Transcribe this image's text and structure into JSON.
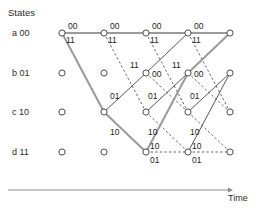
{
  "figure": {
    "type": "trellis-diagram",
    "title": "States",
    "axis_label": "Time",
    "states": [
      {
        "key": "a",
        "bits": "00",
        "label": "a 00",
        "row": 0
      },
      {
        "key": "b",
        "bits": "01",
        "label": "b 01",
        "row": 1
      },
      {
        "key": "c",
        "bits": "10",
        "label": "c 10",
        "row": 2
      },
      {
        "key": "d",
        "bits": "11",
        "label": "d 11",
        "row": 3
      }
    ],
    "colors": {
      "node_stroke": "#3a3a3a",
      "node_fill": "#ffffff",
      "edge_solid": "#3a3a3a",
      "edge_dashed": "#4a4a4a",
      "edge_highlight": "#9a9a9a",
      "axis": "#8a8a8a",
      "text": "#2b2b2b"
    },
    "geometry": {
      "columns_x": [
        62,
        104,
        146,
        188,
        230
      ],
      "rows_y": [
        33,
        73,
        112,
        152
      ],
      "node_radius": 3.1,
      "axis_y": 190,
      "axis_x_start": 8,
      "axis_x_end": 228
    },
    "nodes": [
      {
        "col": 0,
        "row": 0
      },
      {
        "col": 0,
        "row": 1
      },
      {
        "col": 0,
        "row": 2
      },
      {
        "col": 0,
        "row": 3
      },
      {
        "col": 1,
        "row": 0
      },
      {
        "col": 1,
        "row": 1
      },
      {
        "col": 1,
        "row": 2
      },
      {
        "col": 1,
        "row": 3
      },
      {
        "col": 2,
        "row": 0
      },
      {
        "col": 2,
        "row": 1
      },
      {
        "col": 2,
        "row": 2
      },
      {
        "col": 2,
        "row": 3
      },
      {
        "col": 3,
        "row": 0
      },
      {
        "col": 3,
        "row": 1
      },
      {
        "col": 3,
        "row": 2
      },
      {
        "col": 3,
        "row": 3
      },
      {
        "col": 4,
        "row": 0
      },
      {
        "col": 4,
        "row": 1
      },
      {
        "col": 4,
        "row": 2
      },
      {
        "col": 4,
        "row": 3
      }
    ],
    "edges": [
      {
        "from": [
          0,
          0
        ],
        "to": [
          1,
          0
        ],
        "style": "solid",
        "highlight": true,
        "label": "00",
        "label_pos": "above-start"
      },
      {
        "from": [
          0,
          0
        ],
        "to": [
          1,
          2
        ],
        "style": "solid",
        "highlight": true,
        "label": "11",
        "label_pos": "below-start"
      },
      {
        "from": [
          1,
          0
        ],
        "to": [
          2,
          0
        ],
        "style": "solid",
        "highlight": true,
        "label": "00",
        "label_pos": "above-start"
      },
      {
        "from": [
          1,
          0
        ],
        "to": [
          2,
          2
        ],
        "style": "dashed",
        "highlight": false,
        "label": "11",
        "label_pos": "below-start"
      },
      {
        "from": [
          1,
          2
        ],
        "to": [
          2,
          1
        ],
        "style": "solid",
        "highlight": false,
        "label": "01",
        "label_pos": "above-start"
      },
      {
        "from": [
          1,
          2
        ],
        "to": [
          2,
          3
        ],
        "style": "solid",
        "highlight": true,
        "label": "10",
        "label_pos": "below-start"
      },
      {
        "from": [
          2,
          0
        ],
        "to": [
          3,
          0
        ],
        "style": "solid",
        "highlight": true,
        "label": "00",
        "label_pos": "above-start"
      },
      {
        "from": [
          2,
          0
        ],
        "to": [
          3,
          2
        ],
        "style": "dashed",
        "highlight": false,
        "label": "11",
        "label_pos": "below-start"
      },
      {
        "from": [
          2,
          1
        ],
        "to": [
          3,
          0
        ],
        "style": "solid",
        "highlight": false,
        "label": "11",
        "label_pos": "above-start"
      },
      {
        "from": [
          2,
          1
        ],
        "to": [
          3,
          2
        ],
        "style": "dashed",
        "highlight": false,
        "label": "00",
        "label_pos": "right-start"
      },
      {
        "from": [
          2,
          2
        ],
        "to": [
          3,
          1
        ],
        "style": "solid",
        "highlight": false,
        "label": "01",
        "label_pos": "above-start"
      },
      {
        "from": [
          2,
          2
        ],
        "to": [
          3,
          3
        ],
        "style": "dashed",
        "highlight": false,
        "label": "10",
        "label_pos": "below-start"
      },
      {
        "from": [
          2,
          3
        ],
        "to": [
          3,
          1
        ],
        "style": "solid",
        "highlight": true,
        "label": "10",
        "label_pos": "above-start"
      },
      {
        "from": [
          2,
          3
        ],
        "to": [
          3,
          3
        ],
        "style": "dashed",
        "highlight": false,
        "label": "01",
        "label_pos": "below-start"
      },
      {
        "from": [
          3,
          0
        ],
        "to": [
          4,
          0
        ],
        "style": "solid",
        "highlight": true,
        "label": "00",
        "label_pos": "above-start"
      },
      {
        "from": [
          3,
          0
        ],
        "to": [
          4,
          2
        ],
        "style": "dashed",
        "highlight": false,
        "label": "11",
        "label_pos": "below-start"
      },
      {
        "from": [
          3,
          1
        ],
        "to": [
          4,
          0
        ],
        "style": "solid",
        "highlight": true,
        "label": "11",
        "label_pos": "above-start"
      },
      {
        "from": [
          3,
          1
        ],
        "to": [
          4,
          2
        ],
        "style": "dashed",
        "highlight": false,
        "label": "00",
        "label_pos": "right-start"
      },
      {
        "from": [
          3,
          2
        ],
        "to": [
          4,
          1
        ],
        "style": "solid",
        "highlight": false,
        "label": "01",
        "label_pos": "above-start"
      },
      {
        "from": [
          3,
          2
        ],
        "to": [
          4,
          3
        ],
        "style": "dashed",
        "highlight": false,
        "label": "10",
        "label_pos": "below-start"
      },
      {
        "from": [
          3,
          3
        ],
        "to": [
          4,
          1
        ],
        "style": "solid",
        "highlight": false,
        "label": "10",
        "label_pos": "above-start"
      },
      {
        "from": [
          3,
          3
        ],
        "to": [
          4,
          3
        ],
        "style": "dashed",
        "highlight": false,
        "label": "01",
        "label_pos": "below-start"
      }
    ],
    "highlight_path": [
      [
        0,
        0
      ],
      [
        1,
        2
      ],
      [
        2,
        3
      ],
      [
        3,
        1
      ],
      [
        4,
        0
      ]
    ],
    "edge_label_overrides": [
      {
        "x": 68,
        "y": 22,
        "text": "00"
      },
      {
        "x": 66,
        "y": 36,
        "text": "11"
      },
      {
        "x": 110,
        "y": 22,
        "text": "00"
      },
      {
        "x": 108,
        "y": 36,
        "text": "11"
      },
      {
        "x": 152,
        "y": 22,
        "text": "00"
      },
      {
        "x": 150,
        "y": 36,
        "text": "11"
      },
      {
        "x": 194,
        "y": 22,
        "text": "00"
      },
      {
        "x": 192,
        "y": 36,
        "text": "11"
      },
      {
        "x": 130,
        "y": 61,
        "text": "11"
      },
      {
        "x": 152,
        "y": 70,
        "text": "00"
      },
      {
        "x": 172,
        "y": 61,
        "text": "11"
      },
      {
        "x": 194,
        "y": 70,
        "text": "00"
      },
      {
        "x": 110,
        "y": 92,
        "text": "01"
      },
      {
        "x": 148,
        "y": 92,
        "text": "01"
      },
      {
        "x": 190,
        "y": 92,
        "text": "01"
      },
      {
        "x": 110,
        "y": 128,
        "text": "10"
      },
      {
        "x": 148,
        "y": 128,
        "text": "10"
      },
      {
        "x": 190,
        "y": 128,
        "text": "10"
      },
      {
        "x": 150,
        "y": 142,
        "text": "10"
      },
      {
        "x": 150,
        "y": 156,
        "text": "01"
      },
      {
        "x": 192,
        "y": 142,
        "text": "10"
      },
      {
        "x": 192,
        "y": 156,
        "text": "01"
      }
    ]
  }
}
